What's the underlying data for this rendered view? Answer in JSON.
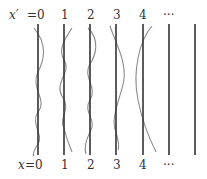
{
  "diagram": {
    "top_axis_label": "x′",
    "bottom_axis_label": "x",
    "top_ticks": [
      "=0",
      "1",
      "2",
      "3",
      "4",
      "···"
    ],
    "bottom_ticks": [
      "=0",
      "1",
      "2",
      "3",
      "4",
      "···"
    ],
    "line_count": 7,
    "line_x": [
      38,
      64,
      90,
      116,
      143,
      169,
      195
    ],
    "line_color": "#333333",
    "curve_color": "#888888"
  }
}
